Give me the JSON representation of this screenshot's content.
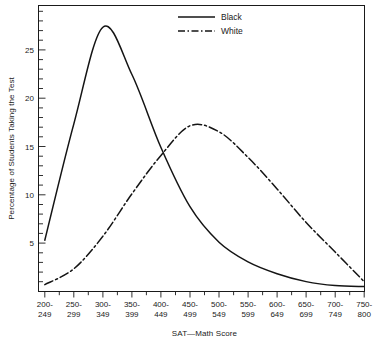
{
  "chart_data": {
    "type": "line",
    "title": "",
    "xlabel": "SAT—Math Score",
    "ylabel": "Percentage of Students Taking the Test",
    "categories": [
      "200-249",
      "250-299",
      "300-349",
      "350-399",
      "400-449",
      "450-499",
      "500-549",
      "550-599",
      "600-649",
      "650-699",
      "700-749",
      "750-800"
    ],
    "xtick_labels_line1": [
      "200-",
      "250-",
      "300-",
      "350-",
      "400-",
      "450-",
      "500-",
      "550-",
      "600-",
      "650-",
      "700-",
      "750-"
    ],
    "xtick_labels_line2": [
      "249",
      "299",
      "349",
      "399",
      "449",
      "499",
      "549",
      "599",
      "649",
      "699",
      "749",
      "800"
    ],
    "ytick_labels": [
      "5",
      "10",
      "15",
      "20",
      "25"
    ],
    "ytick_values": [
      5,
      10,
      15,
      20,
      25
    ],
    "ylim": [
      0,
      29
    ],
    "xlim": [
      0,
      11
    ],
    "grid": false,
    "minor_ticks": true,
    "legend_position": "top-center",
    "series": [
      {
        "name": "Black",
        "style": "solid",
        "color": "#141414",
        "values": [
          5.2,
          17.0,
          26.8,
          22.0,
          14.6,
          8.6,
          5.0,
          3.0,
          1.8,
          1.0,
          0.6,
          0.5
        ]
      },
      {
        "name": "White",
        "style": "dash-dot",
        "color": "#141414",
        "values": [
          0.7,
          2.3,
          5.6,
          9.9,
          13.8,
          16.8,
          16.2,
          13.6,
          10.4,
          7.0,
          4.0,
          1.0
        ]
      }
    ],
    "annotations": {
      "crossing_point": "approximately 13.7% between 400-449 and 450-499",
      "black_peak": "26.8% at 300-349",
      "white_peak": "16.8% at 450-499"
    }
  },
  "legend": {
    "items": [
      {
        "label": "Black",
        "style": "solid"
      },
      {
        "label": "White",
        "style": "dash-dot"
      }
    ]
  }
}
